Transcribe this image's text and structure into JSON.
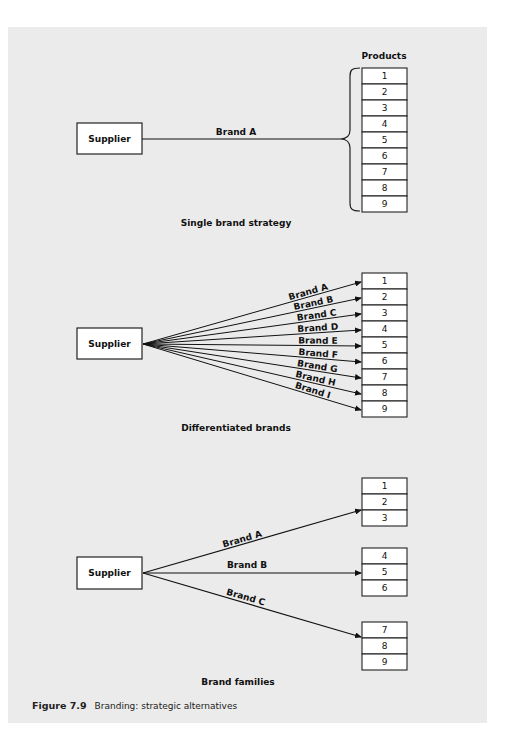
{
  "figure": {
    "number_label": "Figure 7.9",
    "caption": "Branding: strategic alternatives"
  },
  "single_brand": {
    "title": "Single brand strategy",
    "supplier_label": "Supplier",
    "products_header": "Products",
    "brand_label": "Brand A",
    "products": [
      "1",
      "2",
      "3",
      "4",
      "5",
      "6",
      "7",
      "8",
      "9"
    ]
  },
  "differentiated": {
    "title": "Differentiated brands",
    "supplier_label": "Supplier",
    "brands": [
      "Brand A",
      "Brand B",
      "Brand C",
      "Brand D",
      "Brand E",
      "Brand F",
      "Brand G",
      "Brand H",
      "Brand I"
    ],
    "products": [
      "1",
      "2",
      "3",
      "4",
      "5",
      "6",
      "7",
      "8",
      "9"
    ]
  },
  "families": {
    "title": "Brand families",
    "supplier_label": "Supplier",
    "brands": [
      "Brand A",
      "Brand B",
      "Brand C"
    ],
    "groups": [
      [
        "1",
        "2",
        "3"
      ],
      [
        "4",
        "5",
        "6"
      ],
      [
        "7",
        "8",
        "9"
      ]
    ]
  }
}
